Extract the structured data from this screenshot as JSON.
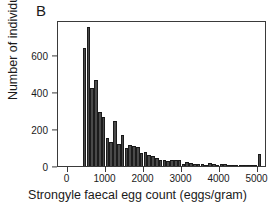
{
  "chart_data": {
    "type": "bar",
    "title": "",
    "panel_label": "B",
    "xlabel": "Strongyle faecal egg count (eggs/gram)",
    "ylabel": "Number of individuals",
    "xlim": [
      -250,
      5250
    ],
    "ylim": [
      0,
      790
    ],
    "grid": false,
    "legend": null,
    "bin_width": 100,
    "xticks": [
      0,
      1000,
      2000,
      3000,
      4000,
      5000
    ],
    "xtick_labels": [
      "0",
      "1000",
      "2000",
      "3000",
      "4000",
      "5000"
    ],
    "yticks": [
      0,
      200,
      400,
      600
    ],
    "ytick_labels": [
      "0",
      "200",
      "400",
      "600"
    ],
    "bar_color": "#4a4a4a",
    "bar_edge_color": "#161616",
    "note": "Bin centers are the left edge of each 100 eggs/gram bin; terminal spike at 5000 reflects capped counts.",
    "bins": [
      450,
      550,
      650,
      750,
      850,
      950,
      1050,
      1150,
      1250,
      1350,
      1450,
      1550,
      1650,
      1750,
      1850,
      1950,
      2050,
      2150,
      2250,
      2350,
      2450,
      2550,
      2650,
      2750,
      2850,
      2950,
      3050,
      3150,
      3250,
      3350,
      3450,
      3550,
      3650,
      3750,
      3850,
      3950,
      4050,
      4150,
      4250,
      4350,
      4450,
      4550,
      4650,
      4750,
      4850,
      4950,
      5050
    ],
    "values": [
      640,
      750,
      420,
      465,
      290,
      265,
      150,
      130,
      245,
      120,
      170,
      95,
      115,
      110,
      105,
      70,
      75,
      60,
      55,
      45,
      30,
      35,
      25,
      35,
      35,
      30,
      12,
      20,
      15,
      12,
      10,
      12,
      8,
      15,
      10,
      8,
      12,
      10,
      6,
      8,
      6,
      5,
      5,
      6,
      4,
      4,
      65
    ]
  }
}
